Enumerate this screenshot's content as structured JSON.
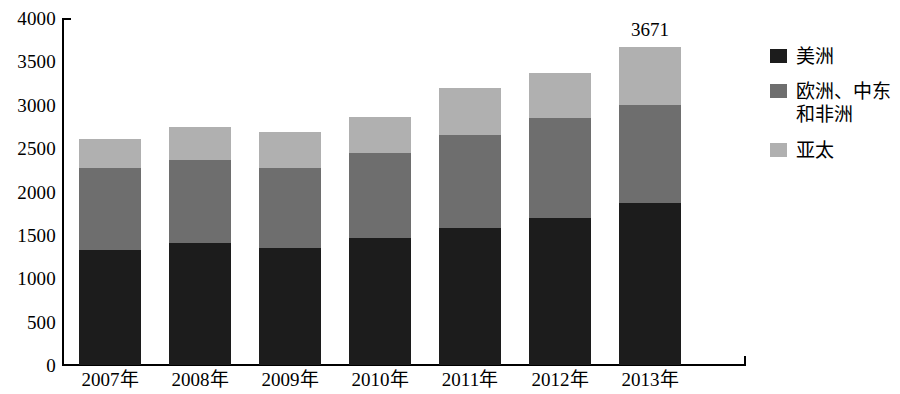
{
  "chart_data": {
    "type": "bar",
    "subtype": "stacked-bar",
    "title": "",
    "subtitle": "",
    "xlabel": "",
    "ylabel": "",
    "categories": [
      "2007年",
      "2008年",
      "2009年",
      "2010年",
      "2011年",
      "2012年",
      "2013年"
    ],
    "series": [
      {
        "name": "美洲",
        "color": "#1c1c1c",
        "values": [
          1325,
          1406,
          1348,
          1463,
          1578,
          1694,
          1866
        ]
      },
      {
        "name": "欧洲、中东\n和非洲",
        "color": "#6e6e6e",
        "values": [
          945,
          956,
          922,
          979,
          1072,
          1152,
          1129
        ]
      },
      {
        "name": "亚太",
        "color": "#b0b0b0",
        "values": [
          335,
          380,
          415,
          415,
          541,
          518,
          676
        ]
      }
    ],
    "totals": [
      2605,
      2742,
      2685,
      2857,
      3191,
      3364,
      3671
    ],
    "ylim": [
      0,
      4000
    ],
    "yticks": [
      0,
      500,
      1000,
      1500,
      2000,
      2500,
      3000,
      3500,
      4000
    ],
    "ytick_labels": [
      "0",
      "500",
      "1000",
      "1500",
      "2000",
      "2500",
      "3000",
      "3500",
      "4000"
    ],
    "grid": false,
    "legend_position": "right",
    "data_labels": [
      {
        "category": "2013年",
        "text": "3671",
        "value": 3671
      }
    ]
  },
  "legend": {
    "items": [
      {
        "label": "美洲",
        "color": "#1c1c1c"
      },
      {
        "label": "欧洲、中东\n和非洲",
        "color": "#6e6e6e"
      },
      {
        "label": "亚太",
        "color": "#b0b0b0"
      }
    ]
  }
}
